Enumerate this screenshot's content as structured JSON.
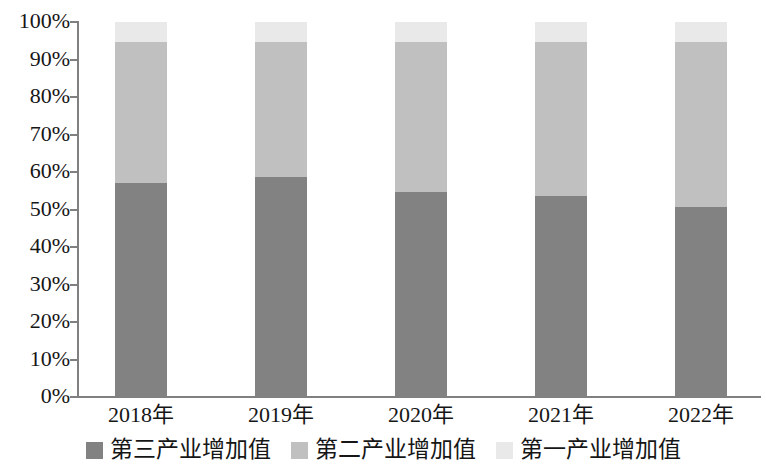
{
  "chart_data": {
    "type": "bar",
    "subtype": "stacked-percent",
    "title": "",
    "xlabel": "",
    "ylabel": "",
    "categories": [
      "2018年",
      "2019年",
      "2020年",
      "2021年",
      "2022年"
    ],
    "ylim": [
      0,
      100
    ],
    "yticks": [
      "0%",
      "10%",
      "20%",
      "30%",
      "40%",
      "50%",
      "60%",
      "70%",
      "80%",
      "90%",
      "100%"
    ],
    "ytick_values": [
      0,
      10,
      20,
      30,
      40,
      50,
      60,
      70,
      80,
      90,
      100
    ],
    "grid": false,
    "legend_position": "bottom",
    "series": [
      {
        "name": "第三产业增加值",
        "color": "#828282",
        "values": [
          57.2,
          58.8,
          54.7,
          53.6,
          50.7
        ]
      },
      {
        "name": "第二产业增加值",
        "color": "#c0c0c0",
        "values": [
          37.6,
          36.0,
          40.1,
          41.2,
          44.1
        ]
      },
      {
        "name": "第一产业增加值",
        "color": "#e9e9e9",
        "values": [
          5.2,
          5.2,
          5.2,
          5.2,
          5.2
        ]
      }
    ]
  },
  "axis": {
    "y_labels": [
      "100%",
      "90%",
      "80%",
      "70%",
      "60%",
      "50%",
      "40%",
      "30%",
      "20%",
      "10%",
      "0%"
    ]
  },
  "legend": {
    "items": [
      {
        "label": "第三产业增加值",
        "color": "#828282"
      },
      {
        "label": "第二产业增加值",
        "color": "#c0c0c0"
      },
      {
        "label": "第一产业增加值",
        "color": "#e9e9e9"
      }
    ]
  }
}
